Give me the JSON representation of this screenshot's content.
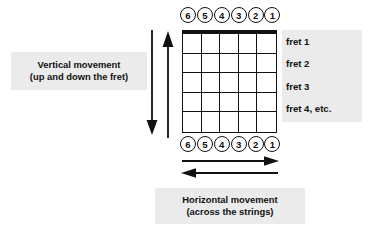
{
  "diagram": {
    "strings_top": [
      {
        "label": "6"
      },
      {
        "label": "5"
      },
      {
        "label": "4"
      },
      {
        "label": "3"
      },
      {
        "label": "2"
      },
      {
        "label": "1"
      }
    ],
    "strings_bottom": [
      {
        "label": "6"
      },
      {
        "label": "5"
      },
      {
        "label": "4"
      },
      {
        "label": "3"
      },
      {
        "label": "2"
      },
      {
        "label": "1"
      }
    ],
    "fret_labels": [
      {
        "text": "fret 1"
      },
      {
        "text": "fret 2"
      },
      {
        "text": "fret 3"
      },
      {
        "text": "fret 4, etc."
      }
    ],
    "vertical_caption": {
      "line1": "Vertical movement",
      "line2": "(up and down the fret)"
    },
    "horizontal_caption": {
      "line1": "Horizontal movement",
      "line2": "(across the strings)"
    },
    "grid": {
      "columns": 5,
      "rows": 5
    },
    "colors": {
      "ink": "#111111",
      "caption_background": "#ebebeb",
      "page_background": "#ffffff"
    },
    "arrows": {
      "vertical_down": "down-arrow",
      "vertical_up": "up-arrow",
      "horizontal_right": "right-arrow",
      "horizontal_left": "left-arrow"
    }
  }
}
